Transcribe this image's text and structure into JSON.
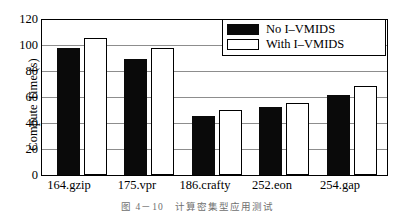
{
  "chart_data": {
    "type": "bar",
    "title": "",
    "xlabel": "",
    "ylabel": "Compute Time (s)",
    "categories": [
      "164.gzip",
      "175.vpr",
      "186.crafty",
      "252.eon",
      "254.gap"
    ],
    "series": [
      {
        "name": "No I–VMIDS",
        "color": "#0a0a0a",
        "values": [
          97,
          89,
          45,
          52,
          61
        ]
      },
      {
        "name": "With I–VMIDS",
        "color": "#ffffff",
        "values": [
          105,
          97,
          50,
          55,
          68
        ]
      }
    ],
    "ylim": [
      0,
      120
    ],
    "yticks": [
      0,
      20,
      40,
      60,
      80,
      100,
      120
    ],
    "ytick_labels": [
      "0",
      "20",
      "40",
      "60",
      "80",
      "100",
      "120"
    ],
    "grid": true,
    "legend_position": "top-right"
  },
  "caption": "图 4－10　计算密集型应用测试"
}
